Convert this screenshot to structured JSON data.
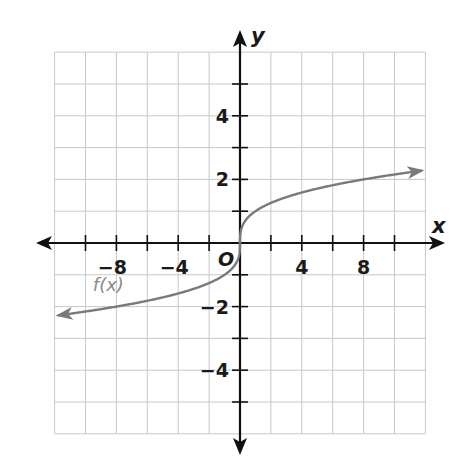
{
  "chart_data": {
    "type": "line",
    "title": "",
    "xlabel": "x",
    "ylabel": "y",
    "origin_label": "O",
    "xlim": [
      -12,
      12
    ],
    "ylim": [
      -6,
      6
    ],
    "grid": true,
    "grid_step_x": 2,
    "grid_step_y": 1,
    "x_tick_labels": [
      {
        "value": -8,
        "label": "−8"
      },
      {
        "value": -4,
        "label": "−4"
      },
      {
        "value": 4,
        "label": "4"
      },
      {
        "value": 8,
        "label": "8"
      }
    ],
    "y_tick_labels": [
      {
        "value": 4,
        "label": "4"
      },
      {
        "value": 2,
        "label": "2"
      },
      {
        "value": -2,
        "label": "−2"
      },
      {
        "value": -4,
        "label": "−4"
      }
    ],
    "series": [
      {
        "name": "f(x)",
        "label": "f(x)",
        "function": "cube root of x",
        "color": "#7a7a7a",
        "arrows_both_ends": true,
        "x": [
          -11.8,
          -8,
          -6,
          -4,
          -2,
          -1,
          -0.5,
          -0.125,
          0,
          0.125,
          0.5,
          1,
          2,
          4,
          6,
          8,
          11.8
        ],
        "y": [
          -2.28,
          -2,
          -1.82,
          -1.59,
          -1.26,
          -1,
          -0.79,
          -0.5,
          0,
          0.5,
          0.79,
          1,
          1.26,
          1.59,
          1.82,
          2,
          2.28
        ]
      }
    ],
    "annotations": [
      {
        "text": "f(x)",
        "x": -9.2,
        "y": -1.45
      }
    ]
  },
  "layout": {
    "origin_px": [
      240,
      243
    ],
    "unit_px_x": 15.45,
    "unit_px_y": 31.8
  },
  "colors": {
    "grid": "#c8c8c8",
    "axis": "#111111",
    "curve": "#7a7a7a"
  }
}
